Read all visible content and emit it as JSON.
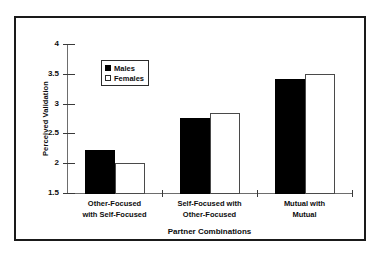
{
  "chart_data": {
    "type": "bar",
    "title": "",
    "xlabel": "Partner Combinations",
    "ylabel": "Perceived Validation",
    "categories": [
      "Other-Focused with Self-Focused",
      "Self-Focused with Other-Focused",
      "Mutual with Mutual"
    ],
    "category_lines": [
      [
        "Other-Focused",
        "with Self-Focused"
      ],
      [
        "Self-Focused with",
        "Other-Focused"
      ],
      [
        "Mutual with",
        "Mutual"
      ]
    ],
    "series": [
      {
        "name": "Males",
        "values": [
          2.22,
          2.76,
          3.41
        ]
      },
      {
        "name": "Females",
        "values": [
          2.0,
          2.84,
          3.5
        ]
      }
    ],
    "ylim": [
      1.5,
      4
    ],
    "yticks": [
      1.5,
      2,
      2.5,
      3,
      3.5,
      4
    ],
    "ytick_labels": [
      "1.5",
      "2",
      "2.5",
      "3",
      "3.5",
      "4"
    ],
    "grid": false,
    "legend_position": "upper-left",
    "colors": {
      "males": "#000000",
      "females": "#ffffff",
      "axis": "#6d6d6d",
      "frame": "#1a1a1a",
      "text": "#0d0d0d"
    }
  }
}
